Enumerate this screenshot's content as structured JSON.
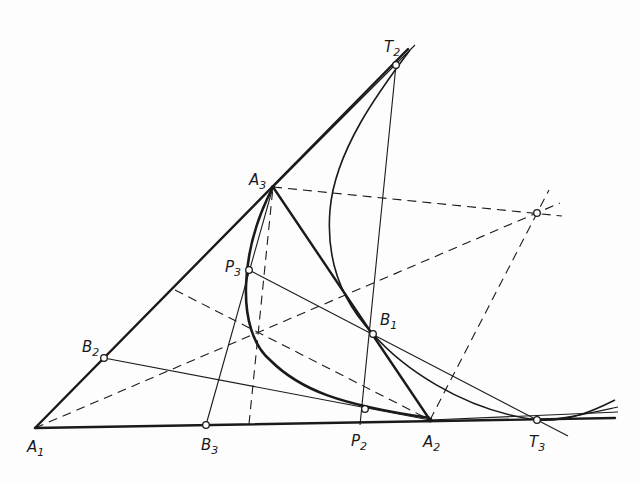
{
  "diagram": {
    "type": "geometric-construction",
    "colors": {
      "ink": "#1a1a1a",
      "paper": "#fdfdfd"
    },
    "points": {
      "A1": {
        "label": "A",
        "sub": "1",
        "x": 35,
        "y": 428
      },
      "A2": {
        "label": "A",
        "sub": "2",
        "x": 430,
        "y": 420
      },
      "A3": {
        "label": "A",
        "sub": "3",
        "x": 273,
        "y": 187
      },
      "B1": {
        "label": "B",
        "sub": "1",
        "x": 373,
        "y": 334
      },
      "B2": {
        "label": "B",
        "sub": "2",
        "x": 104,
        "y": 358
      },
      "B3": {
        "label": "B",
        "sub": "3",
        "x": 206,
        "y": 425
      },
      "P2": {
        "label": "P",
        "sub": "2",
        "x": 365,
        "y": 409
      },
      "P3": {
        "label": "P",
        "sub": "3",
        "x": 249,
        "y": 270
      },
      "T2": {
        "label": "T",
        "sub": "2",
        "x": 396,
        "y": 65
      },
      "T3": {
        "label": "T",
        "sub": "3",
        "x": 537,
        "y": 420
      },
      "X": {
        "label": "",
        "sub": "",
        "x": 537,
        "y": 213
      }
    },
    "labels": [
      {
        "id": "A1",
        "text": "A",
        "sub": "1"
      },
      {
        "id": "A2",
        "text": "A",
        "sub": "2"
      },
      {
        "id": "A3",
        "text": "A",
        "sub": "3"
      },
      {
        "id": "B1",
        "text": "B",
        "sub": "1"
      },
      {
        "id": "B2",
        "text": "B",
        "sub": "2"
      },
      {
        "id": "B3",
        "text": "B",
        "sub": "3"
      },
      {
        "id": "P2",
        "text": "P",
        "sub": "2"
      },
      {
        "id": "P3",
        "text": "P",
        "sub": "3"
      },
      {
        "id": "T2",
        "text": "T",
        "sub": "2"
      },
      {
        "id": "T3",
        "text": "T",
        "sub": "3"
      }
    ]
  }
}
